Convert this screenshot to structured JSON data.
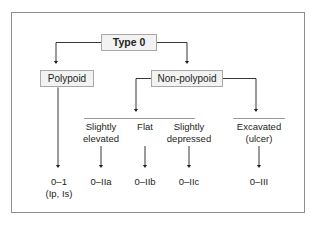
{
  "figure": {
    "border_color": "#8d8d8d",
    "box_fill": "#f2f2f2",
    "box_border": "#a8a8a8",
    "line_color": "#231f20"
  },
  "nodes": {
    "root": {
      "label": "Type 0"
    },
    "polypoid": {
      "label": "Polypoid"
    },
    "nonpolypoid": {
      "label": "Non-polypoid"
    }
  },
  "subtypes": [
    {
      "name": "slightly-elevated",
      "line1": "Slightly",
      "line2": "elevated"
    },
    {
      "name": "flat",
      "line1": "Flat",
      "line2": ""
    },
    {
      "name": "slightly-depressed",
      "line1": "Slightly",
      "line2": "depressed"
    },
    {
      "name": "excavated",
      "line1": "Excavated",
      "line2": "(ulcer)"
    }
  ],
  "codes": [
    {
      "name": "polypoid",
      "line1": "0–1",
      "line2": "(Ip, Is)"
    },
    {
      "name": "slightly-elevated",
      "line1": "0–IIa",
      "line2": ""
    },
    {
      "name": "flat",
      "line1": "0–IIb",
      "line2": ""
    },
    {
      "name": "slightly-depressed",
      "line1": "0–IIc",
      "line2": ""
    },
    {
      "name": "excavated",
      "line1": "0–III",
      "line2": ""
    }
  ]
}
